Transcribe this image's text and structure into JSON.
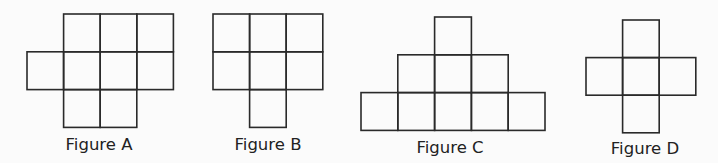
{
  "figures": [
    {
      "id": "A",
      "label": "Figure A",
      "grid": [
        [
          0,
          1,
          1,
          1
        ],
        [
          1,
          1,
          1,
          1
        ],
        [
          0,
          1,
          1,
          0
        ]
      ]
    },
    {
      "id": "B",
      "label": "Figure B",
      "grid": [
        [
          1,
          1,
          1
        ],
        [
          1,
          1,
          1
        ],
        [
          0,
          1,
          0
        ]
      ]
    },
    {
      "id": "C",
      "label": "Figure C",
      "grid": [
        [
          0,
          0,
          1,
          0,
          0
        ],
        [
          0,
          1,
          1,
          1,
          0
        ],
        [
          1,
          1,
          1,
          1,
          1
        ]
      ]
    },
    {
      "id": "D",
      "label": "Figure D",
      "grid": [
        [
          0,
          1,
          0
        ],
        [
          1,
          1,
          1
        ],
        [
          0,
          1,
          0
        ]
      ]
    }
  ]
}
